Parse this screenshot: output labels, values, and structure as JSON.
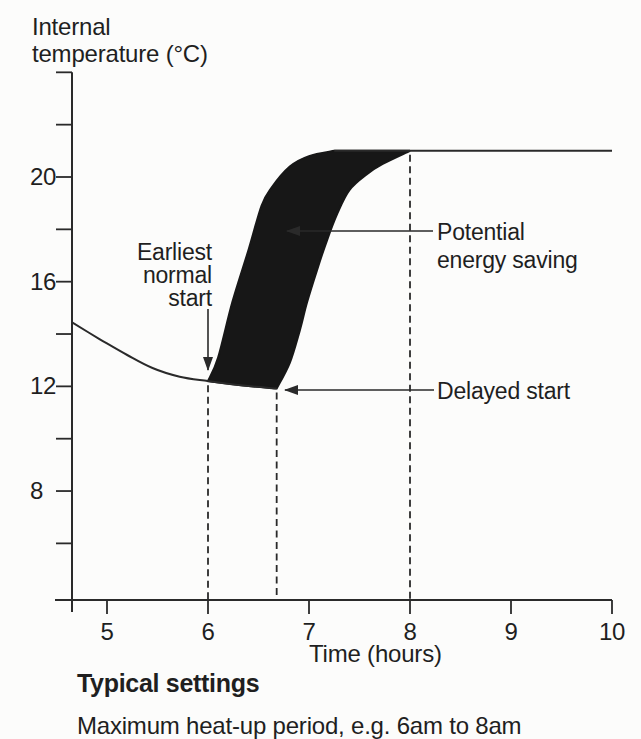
{
  "chart": {
    "y_axis_title": "Internal\ntemperature (°C)",
    "x_axis_title": "Time (hours)",
    "annotations": {
      "earliest": "Earliest\nnormal\nstart",
      "potential": "Potential\nenergy saving",
      "delayed": "Delayed start"
    }
  },
  "footer": {
    "heading": "Typical settings",
    "note": "Maximum heat-up period, e.g. 6am to 8am"
  },
  "colors": {
    "ink": "#1f1f1f",
    "line": "#2a2a2a",
    "shade_fill": "#171717",
    "background": "#fcfcfb"
  },
  "chart_data": {
    "type": "area",
    "title": "",
    "xlabel": "Time (hours)",
    "ylabel": "Internal temperature (°C)",
    "xlim": [
      4.65,
      10
    ],
    "ylim": [
      4,
      24
    ],
    "grid": false,
    "x_ticks": [
      5,
      6,
      7,
      8,
      9,
      10
    ],
    "y_ticks_labeled": [
      20,
      16,
      12,
      8
    ],
    "y_ticks_minor": [
      24,
      22,
      18,
      14,
      10,
      6
    ],
    "setpoint_temperature": 21,
    "series": [
      {
        "name": "room-cooling-curve",
        "points": [
          [
            4.65,
            14.45
          ],
          [
            4.93,
            13.8
          ],
          [
            5.2,
            13.2
          ],
          [
            5.45,
            12.7
          ],
          [
            5.72,
            12.37
          ],
          [
            6.0,
            12.2
          ],
          [
            6.35,
            12.03
          ],
          [
            6.68,
            11.92
          ]
        ]
      },
      {
        "name": "earliest-normal-start-heatup",
        "points": [
          [
            6.0,
            12.2
          ],
          [
            6.1,
            13.1
          ],
          [
            6.24,
            15.2
          ],
          [
            6.4,
            17.2
          ],
          [
            6.53,
            18.9
          ],
          [
            6.63,
            19.6
          ],
          [
            6.81,
            20.4
          ],
          [
            7.0,
            20.8
          ],
          [
            7.25,
            21.0
          ]
        ]
      },
      {
        "name": "delayed-start-heatup",
        "points": [
          [
            6.68,
            11.92
          ],
          [
            6.81,
            12.9
          ],
          [
            6.91,
            14.15
          ],
          [
            6.98,
            15.2
          ],
          [
            7.08,
            16.45
          ],
          [
            7.18,
            17.6
          ],
          [
            7.28,
            18.6
          ],
          [
            7.4,
            19.5
          ],
          [
            7.57,
            20.1
          ],
          [
            7.73,
            20.5
          ],
          [
            8.0,
            21.0
          ]
        ]
      },
      {
        "name": "setpoint-line",
        "points": [
          [
            8.0,
            21.0
          ],
          [
            10.0,
            21.0
          ]
        ]
      }
    ],
    "shaded_region": {
      "between": [
        "earliest-normal-start-heatup",
        "delayed-start-heatup"
      ],
      "meaning": "Potential energy saving",
      "color": "#171717"
    },
    "dashed_guides": [
      {
        "x": 6.0,
        "from_temp": 12.2
      },
      {
        "x": 6.68,
        "from_temp": 11.92
      },
      {
        "x": 8.0,
        "from_temp": 21.0
      }
    ],
    "markers": [
      {
        "label": "Earliest normal start",
        "at": [
          6.0,
          12.2
        ]
      },
      {
        "label": "Delayed start",
        "at": [
          6.68,
          11.92
        ]
      }
    ]
  }
}
